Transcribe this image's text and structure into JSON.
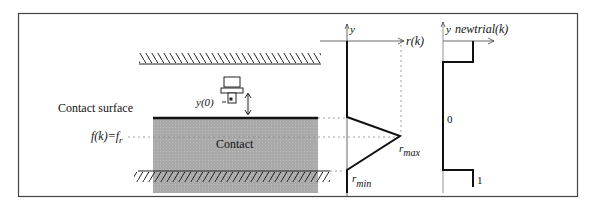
{
  "figure": {
    "left_panel": {
      "contact_surface_label": "Contact surface",
      "contact_region_label": "Contact",
      "y0_label": "y(0)",
      "fk_label": "f(k)=f",
      "fk_subscript": "r"
    },
    "middle_plot": {
      "y_axis_label": "y",
      "x_axis_label": "r(k)",
      "rmax_label": "r",
      "rmax_subscript": "max",
      "rmin_label": "r",
      "rmin_subscript": "min"
    },
    "right_plot": {
      "y_axis_label": "y",
      "x_axis_label": "newtrial(k)",
      "value_zero": "0",
      "value_one": "1"
    }
  },
  "colors": {
    "contact_fill": "#a8a8a8",
    "line": "#111111",
    "frame": "#444444",
    "dotted": "#888888"
  }
}
